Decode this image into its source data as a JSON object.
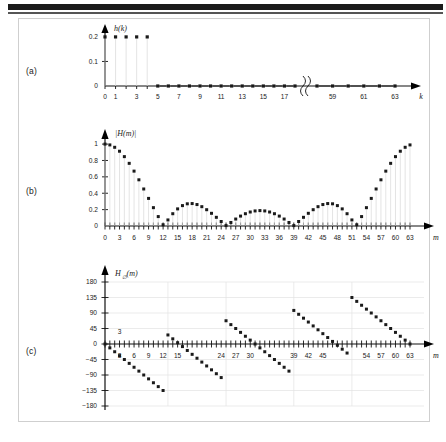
{
  "figure": {
    "panels": [
      {
        "id": "a",
        "label": "(a)",
        "y_axis_title": "h(k)",
        "x_axis_title": "k",
        "y_ticks": [
          "0",
          "0.1",
          "0.2"
        ],
        "y_tick_values": [
          0,
          0.1,
          0.2
        ],
        "x_ticks": [
          "0",
          "1",
          "3",
          "5",
          "7",
          "9",
          "11",
          "13",
          "15",
          "17",
          "59",
          "61",
          "63"
        ],
        "has_axis_break": true,
        "break_between": [
          "17",
          "59"
        ]
      },
      {
        "id": "b",
        "label": "(b)",
        "y_axis_title": "|H(m)|",
        "x_axis_title": "m",
        "y_ticks": [
          "0",
          "0.2",
          "0.4",
          "0.6",
          "0.8",
          "1"
        ],
        "y_tick_values": [
          0,
          0.2,
          0.4,
          0.6,
          0.8,
          1
        ],
        "x_ticks": [
          "0",
          "3",
          "6",
          "9",
          "12",
          "15",
          "18",
          "21",
          "24",
          "27",
          "30",
          "33",
          "36",
          "39",
          "42",
          "45",
          "48",
          "51",
          "54",
          "57",
          "60",
          "63"
        ]
      },
      {
        "id": "c",
        "label": "(c)",
        "y_axis_title": "H",
        "y_axis_title_sub": "∅",
        "y_axis_title_arg": "(m)",
        "x_axis_title": "m",
        "y_ticks": [
          "180",
          "135",
          "90",
          "45",
          "0",
          "−45",
          "−90",
          "−135",
          "−180"
        ],
        "y_tick_values": [
          180,
          135,
          90,
          45,
          0,
          -45,
          -90,
          -135,
          -180
        ],
        "x_ticks": [
          "3",
          "6",
          "9",
          "12",
          "15",
          "24",
          "27",
          "30",
          "39",
          "42",
          "45",
          "54",
          "57",
          "60",
          "63"
        ]
      }
    ]
  },
  "chart_data": [
    {
      "type": "scatter",
      "panel": "a",
      "title": "h(k)",
      "xlabel": "k",
      "ylabel": "h(k)",
      "xlim": [
        0,
        63
      ],
      "ylim": [
        0,
        0.22
      ],
      "yticks": [
        0,
        0.1,
        0.2
      ],
      "ytick_labels": [
        "0",
        "0.1",
        "0.2"
      ],
      "xticks": [
        0,
        1,
        3,
        5,
        7,
        9,
        11,
        13,
        15,
        17,
        59,
        61,
        63
      ],
      "xtick_labels": [
        "0",
        "1",
        "3",
        "5",
        "7",
        "9",
        "11",
        "13",
        "15",
        "17",
        "59",
        "61",
        "63"
      ],
      "grid": false,
      "axis_break": {
        "after": 18,
        "before": 58
      },
      "x": [
        0,
        1,
        2,
        3,
        4,
        5,
        6,
        7,
        8,
        9,
        10,
        11,
        12,
        13,
        14,
        15,
        16,
        17,
        18,
        58,
        59,
        60,
        61,
        62,
        63
      ],
      "values": [
        0.2,
        0.2,
        0.2,
        0.2,
        0.2,
        0,
        0,
        0,
        0,
        0,
        0,
        0,
        0,
        0,
        0,
        0,
        0,
        0,
        0,
        0,
        0,
        0,
        0,
        0,
        0
      ],
      "annotation": "Five unit-amplitude taps of 0.2 for k = 0 to 4; all remaining samples are zero"
    },
    {
      "type": "scatter",
      "panel": "b",
      "title": "|H(m)|",
      "xlabel": "m",
      "ylabel": "|H(m)|",
      "xlim": [
        0,
        63
      ],
      "ylim": [
        0,
        1.05
      ],
      "yticks": [
        0,
        0.2,
        0.4,
        0.6,
        0.8,
        1
      ],
      "ytick_labels": [
        "0",
        "0.2",
        "0.4",
        "0.6",
        "0.8",
        "1"
      ],
      "xticks": [
        0,
        3,
        6,
        9,
        12,
        15,
        18,
        21,
        24,
        27,
        30,
        33,
        36,
        39,
        42,
        45,
        48,
        51,
        54,
        57,
        60,
        63
      ],
      "grid": false,
      "x": [
        0,
        1,
        2,
        3,
        4,
        5,
        6,
        7,
        8,
        9,
        10,
        11,
        12,
        13,
        14,
        15,
        16,
        17,
        18,
        19,
        20,
        21,
        22,
        23,
        24,
        25,
        26,
        27,
        28,
        29,
        30,
        31,
        32,
        33,
        34,
        35,
        36,
        37,
        38,
        39,
        40,
        41,
        42,
        43,
        44,
        45,
        46,
        47,
        48,
        49,
        50,
        51,
        52,
        53,
        54,
        55,
        56,
        57,
        58,
        59,
        60,
        61,
        62,
        63
      ],
      "values": [
        1.0,
        0.99,
        0.961,
        0.913,
        0.847,
        0.765,
        0.67,
        0.564,
        0.452,
        0.337,
        0.224,
        0.115,
        0.015,
        0.074,
        0.15,
        0.209,
        0.249,
        0.271,
        0.274,
        0.262,
        0.236,
        0.199,
        0.155,
        0.106,
        0.055,
        0.005,
        0.043,
        0.085,
        0.121,
        0.15,
        0.171,
        0.184,
        0.188,
        0.184,
        0.171,
        0.15,
        0.121,
        0.085,
        0.043,
        0.005,
        0.055,
        0.106,
        0.155,
        0.199,
        0.236,
        0.262,
        0.274,
        0.271,
        0.249,
        0.209,
        0.15,
        0.074,
        0.015,
        0.115,
        0.224,
        0.337,
        0.452,
        0.564,
        0.67,
        0.765,
        0.847,
        0.913,
        0.961,
        0.99
      ],
      "annotation": "Magnitude of the 64-point DFT of the 5-tap average; main lobe nulls near m = 13, 26, 38, 51"
    },
    {
      "type": "scatter",
      "panel": "c",
      "title": "H∅(m)",
      "xlabel": "m",
      "ylabel": "H∅(m)",
      "xlim": [
        0,
        63
      ],
      "ylim": [
        -180,
        180
      ],
      "yticks": [
        180,
        135,
        90,
        45,
        0,
        -45,
        -90,
        -135,
        -180
      ],
      "ytick_labels": [
        "180",
        "135",
        "90",
        "45",
        "0",
        "−45",
        "−90",
        "−135",
        "−180"
      ],
      "xticks": [
        3,
        6,
        9,
        12,
        15,
        24,
        27,
        30,
        39,
        42,
        45,
        54,
        57,
        60,
        63
      ],
      "grid": true,
      "x": [
        0,
        1,
        2,
        3,
        4,
        5,
        6,
        7,
        8,
        9,
        10,
        11,
        12,
        13,
        14,
        15,
        16,
        17,
        18,
        19,
        20,
        21,
        22,
        23,
        24,
        25,
        26,
        27,
        28,
        29,
        30,
        31,
        32,
        33,
        34,
        35,
        36,
        37,
        38,
        39,
        40,
        41,
        42,
        43,
        44,
        45,
        46,
        47,
        48,
        49,
        50,
        51,
        52,
        53,
        54,
        55,
        56,
        57,
        58,
        59,
        60,
        61,
        62,
        63
      ],
      "values": [
        0,
        -11.25,
        -22.5,
        -33.75,
        -45,
        -56.25,
        -67.5,
        -78.75,
        -90,
        -101.25,
        -112.5,
        -123.75,
        -135,
        26.25,
        15,
        3.75,
        -7.5,
        -18.75,
        -30,
        -41.25,
        -52.5,
        -63.75,
        -75,
        -86.25,
        -97.5,
        67.5,
        56.25,
        45,
        33.75,
        22.5,
        11.25,
        0,
        -11.25,
        -22.5,
        -33.75,
        -45,
        -56.25,
        -67.5,
        -78.75,
        97.5,
        86.25,
        75,
        63.75,
        52.5,
        41.25,
        30,
        18.75,
        7.5,
        -3.75,
        -15,
        -26.25,
        135,
        123.75,
        112.5,
        101.25,
        90,
        78.75,
        67.5,
        56.25,
        45,
        33.75,
        22.5,
        11.25,
        0
      ],
      "annotation": "Linear phase of slope −11.25° per bin, wrapped to the ±180° range, with jumps at the magnitude nulls"
    }
  ]
}
